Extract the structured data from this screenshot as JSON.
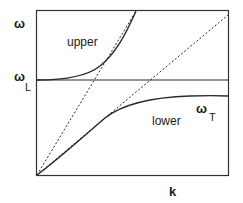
{
  "figure": {
    "type": "dispersion-diagram",
    "axes": {
      "x_label": "k",
      "y_label": "ω"
    },
    "levels": {
      "omega_L": {
        "symbol": "ω",
        "subscript": "L"
      },
      "omega_T": {
        "symbol": "ω",
        "subscript": "T"
      }
    },
    "branches": {
      "upper": "upper",
      "lower": "lower"
    },
    "colors": {
      "line": "#2a2a2a",
      "frame": "#333333",
      "background": "#ffffff"
    }
  }
}
